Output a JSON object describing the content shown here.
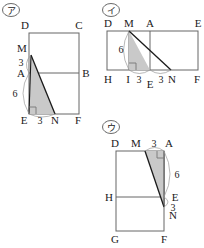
{
  "document": {
    "type": "geometry-figures",
    "figure_count": 3,
    "background_color": "#ffffff",
    "line_color": "#555555",
    "shade_color": "#c8c8c8",
    "bold_line_color": "#1a1a1a",
    "text_color": "#1a1a1a"
  },
  "figures": [
    {
      "id": "a",
      "marker": "ア",
      "shape": "rectangle-with-inner-triangle",
      "vertex_labels": {
        "top_left": "D",
        "top_right": "C",
        "mid_left_upper": "M",
        "mid_left": "A",
        "mid_right": "B",
        "bottom_left": "E",
        "bottom_mid": "N",
        "bottom_right": "F"
      },
      "measurements": [
        {
          "label": "3",
          "segment": "M-A",
          "position": "left"
        },
        {
          "label": "6",
          "segment": "A-E",
          "position": "left"
        },
        {
          "label": "3",
          "segment": "E-N",
          "position": "bottom"
        }
      ],
      "shaded_region": "A-E-N",
      "right_angle_at": "E"
    },
    {
      "id": "i",
      "marker": "イ",
      "shape": "rectangle-with-inner-triangle",
      "vertex_labels": {
        "top_left": "D",
        "top_mid_m": "M",
        "top_mid_a": "A",
        "top_right": "E",
        "bottom_left": "H",
        "bottom_i": "I",
        "bottom_e": "E",
        "bottom_n": "N",
        "bottom_right": "F"
      },
      "measurements": [
        {
          "label": "6",
          "segment": "M-I",
          "position": "left"
        },
        {
          "label": "3",
          "segment": "I-E",
          "position": "bottom"
        },
        {
          "label": "3",
          "segment": "E-N",
          "position": "bottom"
        }
      ],
      "shaded_region": "M-I-E",
      "right_angle_at": "I"
    },
    {
      "id": "u",
      "marker": "ウ",
      "shape": "rectangle-with-inner-triangle",
      "vertex_labels": {
        "top_left": "D",
        "top_m": "M",
        "top_right": "A",
        "mid_left": "H",
        "mid_right": "E",
        "lower_right": "N",
        "bottom_left": "G",
        "bottom_right": "F"
      },
      "measurements": [
        {
          "label": "3",
          "segment": "M-A",
          "position": "top"
        },
        {
          "label": "6",
          "segment": "A-E",
          "position": "right"
        },
        {
          "label": "3",
          "segment": "E-N",
          "position": "right"
        }
      ],
      "shaded_region": "M-A-N",
      "right_angle_at": "A"
    }
  ]
}
